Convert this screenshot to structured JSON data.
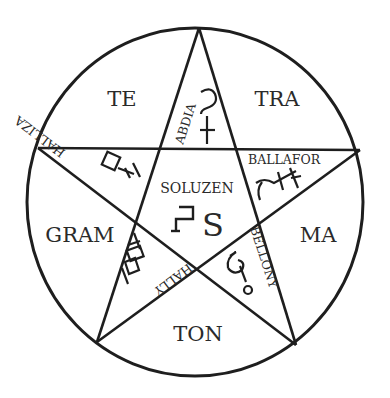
{
  "diagram": {
    "outer_segments": {
      "top_left": "TE",
      "top_right": "TRA",
      "left": "GRAM",
      "right": "MA",
      "bottom": "TON"
    },
    "star_points": {
      "top": "ABDIA",
      "upper_left": "HALLIZA",
      "upper_right": "BALLAFOR",
      "lower_left": "HALLY",
      "lower_right": "BELLONY"
    },
    "center": {
      "label": "SOLUZEN"
    },
    "sigils": {
      "top": "mercury-like-sigil",
      "upper_left": "box-and-cross-sigil",
      "upper_right": "ballafor-sigil",
      "lower_left": "ladder-sigil",
      "lower_right": "hook-and-circle-sigil",
      "center": "bracket-and-s-sigil"
    },
    "colors": {
      "ink": "#1e1e1e",
      "background": "#ffffff"
    }
  }
}
